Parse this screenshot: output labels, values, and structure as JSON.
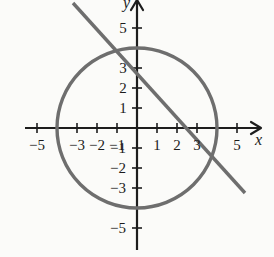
{
  "figure": {
    "panel_label": ")",
    "background_color": "#fbfbf9",
    "curve_color": "#6e6e6e",
    "axis_color": "#1d1d1d"
  },
  "axes": {
    "x_name": "x",
    "y_name": "y",
    "origin_px": {
      "x": 137,
      "y": 128
    },
    "unit_px": 20,
    "x_range": [
      -5.6,
      6.2
    ],
    "y_range": [
      -6.1,
      6.4
    ],
    "x_tick_values": [
      -5,
      -4,
      -3,
      -2,
      -1,
      1,
      2,
      3,
      4,
      5
    ],
    "y_tick_values": [
      -5,
      -4,
      -3,
      -2,
      -1,
      1,
      2,
      3,
      4,
      5
    ],
    "x_tick_labels": [
      {
        "value": -5,
        "text": "−5"
      },
      {
        "value": -3,
        "text": "−3"
      },
      {
        "value": -2,
        "text": "−2"
      },
      {
        "value": -1,
        "text": "−1"
      },
      {
        "value": 1,
        "text": "1"
      },
      {
        "value": 2,
        "text": "2"
      },
      {
        "value": 3,
        "text": "3"
      },
      {
        "value": 5,
        "text": "5"
      }
    ],
    "y_tick_labels": [
      {
        "value": 5,
        "text": "5"
      },
      {
        "value": 3,
        "text": "3"
      },
      {
        "value": 2,
        "text": "2"
      },
      {
        "value": 1,
        "text": "1"
      },
      {
        "value": -1,
        "text": "−1"
      },
      {
        "value": -2,
        "text": "−2"
      },
      {
        "value": -3,
        "text": "−3"
      },
      {
        "value": -5,
        "text": "−5"
      }
    ]
  },
  "chart_data": {
    "type": "line",
    "title": "",
    "xlabel": "x",
    "ylabel": "y",
    "xlim": [
      -5.6,
      6.2
    ],
    "ylim": [
      -6.1,
      6.4
    ],
    "grid": false,
    "legend": "none",
    "series": [
      {
        "name": "circle",
        "kind": "circle",
        "equation": "x^2 + y^2 = 16",
        "center": [
          0,
          0
        ],
        "radius": 4,
        "color": "#6e6e6e",
        "linewidth_px": 3.4
      },
      {
        "name": "line",
        "kind": "line",
        "equation": "y = -x + 3",
        "slope": -1.1,
        "intercept": 3,
        "x_intercept": 3.2,
        "endpoints": [
          [
            -3.2,
            6.25
          ],
          [
            5.4,
            -3.25
          ]
        ],
        "color": "#6e6e6e",
        "linewidth_px": 3.4
      }
    ],
    "intersections": [
      [
        -0.5,
        3.5
      ],
      [
        3.5,
        -0.5
      ]
    ]
  }
}
